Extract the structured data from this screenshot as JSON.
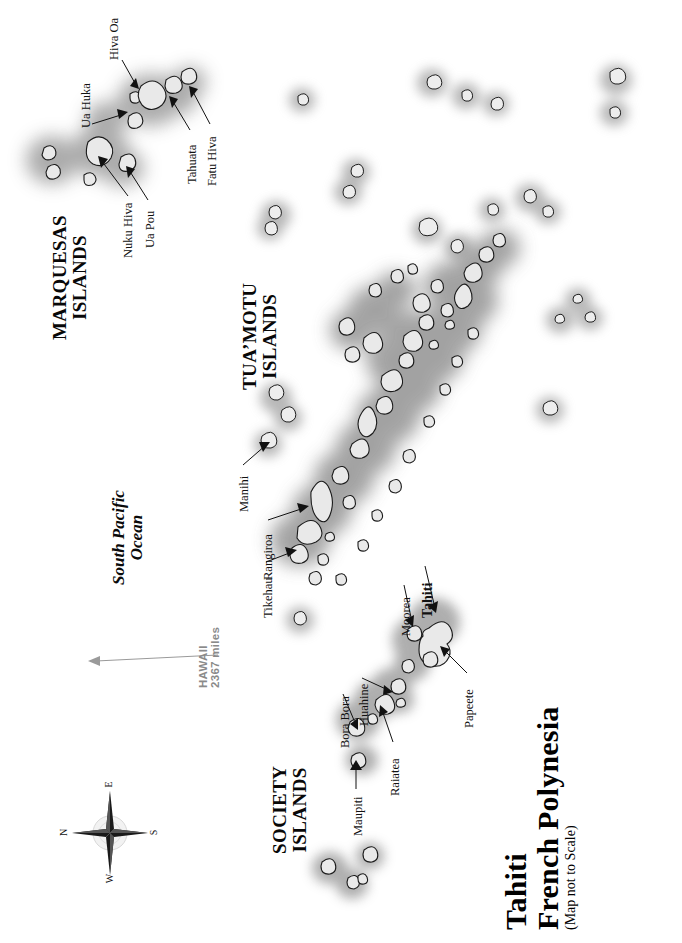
{
  "map": {
    "title_line1": "Tahiti",
    "title_line2": "French Polynesia",
    "title_note": "(Map not to Scale)",
    "ocean_line1": "South Pacific",
    "ocean_line2": "Ocean",
    "orientation_note": "Map and all type rotated 90° (reads bottom-to-top)",
    "background_color": "#ffffff",
    "island_fill": "#e9e9e9",
    "island_stroke": "#1a1a1a",
    "halo_color": "#8c8c8c",
    "distance_marker_color": "#8a8a8a"
  },
  "compass": {
    "name": "compass-rose",
    "north": "N",
    "east": "E",
    "south": "S",
    "west": "W"
  },
  "distance_marker": {
    "destination": "HAWAII",
    "distance": "2367 miles"
  },
  "groups": [
    {
      "id": "marquesas",
      "line1": "MARQUESAS",
      "line2": "ISLANDS"
    },
    {
      "id": "tuamotu",
      "line1": "TUA’MOTU",
      "line2": "ISLANDS"
    },
    {
      "id": "society",
      "line1": "SOCIETY",
      "line2": "ISLANDS"
    }
  ],
  "island_labels": [
    {
      "id": "ua-huka",
      "name": "Ua Huka",
      "group": "marquesas",
      "bold": false
    },
    {
      "id": "hiva-oa",
      "name": "Hiva Oa",
      "group": "marquesas",
      "bold": false
    },
    {
      "id": "nuku-hiva",
      "name": "Nuku Hiva",
      "group": "marquesas",
      "bold": false
    },
    {
      "id": "ua-pou",
      "name": "Ua Pou",
      "group": "marquesas",
      "bold": false
    },
    {
      "id": "tahuata",
      "name": "Tahuata",
      "group": "marquesas",
      "bold": false
    },
    {
      "id": "fatu-hiva",
      "name": "Fatu Hiva",
      "group": "marquesas",
      "bold": false
    },
    {
      "id": "manihi",
      "name": "Manihi",
      "group": "tuamotu",
      "bold": false
    },
    {
      "id": "rangiroa",
      "name": "Rangiroa",
      "group": "tuamotu",
      "bold": false
    },
    {
      "id": "tikehau",
      "name": "Tikehau",
      "group": "tuamotu",
      "bold": false
    },
    {
      "id": "bora-bora",
      "name": "Bora Bora",
      "group": "society",
      "bold": false
    },
    {
      "id": "huahine",
      "name": "Huahine",
      "group": "society",
      "bold": false
    },
    {
      "id": "raiatea",
      "name": "Raiatea",
      "group": "society",
      "bold": false
    },
    {
      "id": "maupiti",
      "name": "Maupiti",
      "group": "society",
      "bold": false
    },
    {
      "id": "moorea",
      "name": "Moorea",
      "group": "society",
      "bold": false
    },
    {
      "id": "tahiti",
      "name": "Tahiti",
      "group": "society",
      "bold": true
    },
    {
      "id": "papeete",
      "name": "Papeete",
      "group": "society",
      "bold": false
    }
  ]
}
